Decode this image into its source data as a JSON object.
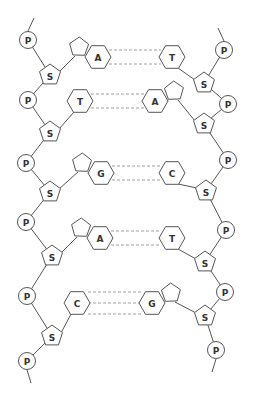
{
  "labels": {
    "phosphate": "P",
    "sugar": "S"
  },
  "colors": {
    "stroke": "#555555",
    "bond": "#888888",
    "text": "#333333",
    "background": "#ffffff"
  },
  "left_strand": {
    "phosphates": [
      {
        "x": 28,
        "y": 40
      },
      {
        "x": 28,
        "y": 100
      },
      {
        "x": 26,
        "y": 163
      },
      {
        "x": 26,
        "y": 222
      },
      {
        "x": 27,
        "y": 296
      },
      {
        "x": 27,
        "y": 361
      }
    ],
    "sugars": [
      {
        "x": 50,
        "y": 75
      },
      {
        "x": 50,
        "y": 132
      },
      {
        "x": 50,
        "y": 192
      },
      {
        "x": 52,
        "y": 256
      },
      {
        "x": 52,
        "y": 336
      }
    ]
  },
  "right_strand": {
    "phosphates": [
      {
        "x": 224,
        "y": 50
      },
      {
        "x": 228,
        "y": 104
      },
      {
        "x": 228,
        "y": 160
      },
      {
        "x": 226,
        "y": 230
      },
      {
        "x": 225,
        "y": 292
      },
      {
        "x": 216,
        "y": 350
      }
    ],
    "sugars": [
      {
        "x": 204,
        "y": 83
      },
      {
        "x": 204,
        "y": 124
      },
      {
        "x": 206,
        "y": 191
      },
      {
        "x": 205,
        "y": 262
      },
      {
        "x": 205,
        "y": 316
      }
    ]
  },
  "base_pairs": [
    {
      "left": "A",
      "right": "T",
      "bonds": 2,
      "left_purine": true,
      "right_purine": false,
      "y": 57,
      "lx": 98,
      "rx": 172
    },
    {
      "left": "T",
      "right": "A",
      "bonds": 2,
      "left_purine": false,
      "right_purine": true,
      "y": 101,
      "lx": 80,
      "rx": 155
    },
    {
      "left": "G",
      "right": "C",
      "bonds": 2,
      "left_purine": true,
      "right_purine": false,
      "y": 173,
      "lx": 101,
      "rx": 172
    },
    {
      "left": "A",
      "right": "T",
      "bonds": 2,
      "left_purine": true,
      "right_purine": false,
      "y": 238,
      "lx": 100,
      "rx": 172
    },
    {
      "left": "C",
      "right": "G",
      "bonds": 3,
      "left_purine": false,
      "right_purine": true,
      "y": 303,
      "lx": 77,
      "rx": 152
    }
  ]
}
